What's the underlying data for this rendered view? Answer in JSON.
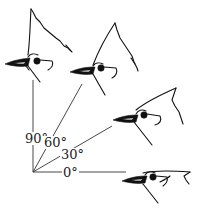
{
  "diagram": {
    "origin": [
      33,
      172
    ],
    "angles": [
      {
        "label": "0°",
        "degrees": 0
      },
      {
        "label": "30°",
        "degrees": 30
      },
      {
        "label": "60°",
        "degrees": 60
      },
      {
        "label": "90°",
        "degrees": 90
      }
    ]
  },
  "colors": {
    "ink": "#111111",
    "background": "#ffffff"
  }
}
